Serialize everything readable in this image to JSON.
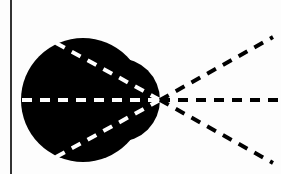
{
  "diagram": {
    "colors": {
      "background": "#fdfdfd",
      "shape": "#000000",
      "dashes_inside": "#ffffff",
      "dashes_outside": "#000000",
      "border_line": "#333333"
    },
    "left_border": {
      "x": 11,
      "y1": 0,
      "y2": 174
    },
    "shape": {
      "large_circle": {
        "cx": 83,
        "cy": 100,
        "r": 62
      },
      "small_circle": {
        "cx": 118,
        "cy": 100,
        "r": 42
      }
    },
    "focal_point": {
      "x": 160,
      "y": 100
    },
    "inner_rays": [
      {
        "x1": 56,
        "y1": 43,
        "x2": 160,
        "y2": 100
      },
      {
        "x1": 22,
        "y1": 100,
        "x2": 160,
        "y2": 100
      },
      {
        "x1": 56,
        "y1": 157,
        "x2": 160,
        "y2": 100
      }
    ],
    "outer_rays": [
      {
        "x1": 160,
        "y1": 100,
        "x2": 273,
        "y2": 37
      },
      {
        "x1": 160,
        "y1": 100,
        "x2": 281,
        "y2": 100
      },
      {
        "x1": 160,
        "y1": 100,
        "x2": 273,
        "y2": 163
      }
    ]
  }
}
